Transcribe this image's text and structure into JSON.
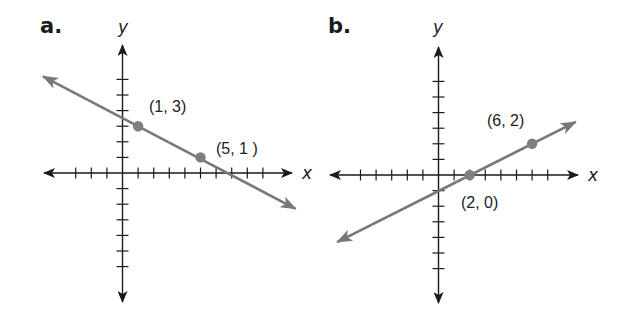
{
  "figure": {
    "panels": [
      {
        "label": "a.",
        "x_axis_label": "x",
        "y_axis_label": "y",
        "origin_px": [
          122.5,
          173
        ],
        "unit_px": 15.6,
        "x_ticks": [
          -3,
          -2,
          -1,
          1,
          2,
          3,
          4,
          5,
          6,
          7,
          8,
          9
        ],
        "y_ticks": [
          -6,
          -5,
          -4,
          -3,
          -2,
          -1,
          1,
          2,
          3,
          4,
          5,
          6
        ],
        "x_axis_range_px": [
          44,
          292
        ],
        "y_axis_range_px": [
          45,
          302
        ],
        "line": {
          "from": [
            -5.1,
            6.2
          ],
          "to": [
            11.1,
            -2.3
          ],
          "color": "#787878"
        },
        "points": [
          {
            "x": 1,
            "y": 3,
            "label": "(1, 3)",
            "label_pos": [
              149,
              112
            ]
          },
          {
            "x": 5,
            "y": 1,
            "label": "(5, 1 )",
            "label_pos": [
              216,
              154
            ]
          }
        ]
      },
      {
        "label": "b.",
        "x_axis_label": "x",
        "y_axis_label": "y",
        "origin_px": [
          438.5,
          175
        ],
        "unit_px": 15.6,
        "x_ticks": [
          -5,
          -4,
          -3,
          -2,
          -1,
          1,
          2,
          3,
          4,
          5,
          6,
          7
        ],
        "y_ticks": [
          -6,
          -5,
          -4,
          -3,
          -2,
          -1,
          1,
          2,
          3,
          4,
          5,
          6
        ],
        "x_axis_range_px": [
          330,
          578
        ],
        "y_axis_range_px": [
          47,
          303
        ],
        "line": {
          "from": [
            -6.5,
            -4.3
          ],
          "to": [
            8.8,
            3.4
          ],
          "color": "#787878"
        },
        "points": [
          {
            "x": 6,
            "y": 2,
            "label": "(6, 2)",
            "label_pos": [
              487,
              126
            ]
          },
          {
            "x": 2,
            "y": 0,
            "label": "(2, 0)",
            "label_pos": [
              461,
              208
            ]
          }
        ]
      }
    ]
  },
  "chart_data": [
    {
      "type": "line",
      "title": "a.",
      "xlabel": "x",
      "ylabel": "y",
      "grid": false,
      "xlim": [
        -5,
        11
      ],
      "ylim": [
        -8,
        8
      ],
      "series": [
        {
          "name": "line through (1, 3) and (5, 1)",
          "x": [
            1,
            5
          ],
          "y": [
            3,
            1
          ]
        }
      ],
      "annotations": [
        "(1, 3)",
        "(5, 1 )"
      ]
    },
    {
      "type": "line",
      "title": "b.",
      "xlabel": "x",
      "ylabel": "y",
      "grid": false,
      "xlim": [
        -7,
        9
      ],
      "ylim": [
        -8,
        8
      ],
      "series": [
        {
          "name": "line through (2, 0) and (6, 2)",
          "x": [
            2,
            6
          ],
          "y": [
            0,
            2
          ]
        }
      ],
      "annotations": [
        "(6, 2)",
        "(2, 0)"
      ]
    }
  ]
}
